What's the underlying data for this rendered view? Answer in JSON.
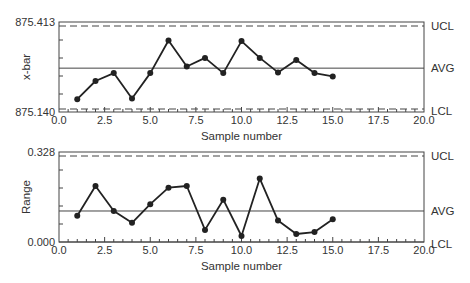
{
  "chart_data": [
    {
      "type": "line",
      "title": "",
      "xlabel": "Sample number",
      "ylabel": "x-bar",
      "xlim": [
        0.0,
        20.0
      ],
      "ylim": [
        875.14,
        875.413
      ],
      "x_tick_labels": [
        "0.0",
        "2.5",
        "5.0",
        "7.5",
        "10.0",
        "12.5",
        "15.0",
        "17.5",
        "20.0"
      ],
      "y_tick_labels": [
        "875.140",
        "875.413"
      ],
      "grid": false,
      "reference_lines": [
        {
          "label": "UCL",
          "value": 875.402,
          "style": "dashed"
        },
        {
          "label": "AVG",
          "value": 875.273,
          "style": "solid"
        },
        {
          "label": "LCL",
          "value": 875.15,
          "style": "dashed"
        }
      ],
      "x": [
        1,
        2,
        3,
        4,
        5,
        6,
        7,
        8,
        9,
        10,
        11,
        12,
        13,
        14,
        15
      ],
      "values": [
        875.179,
        875.234,
        875.258,
        875.181,
        875.258,
        875.357,
        875.278,
        875.304,
        875.258,
        875.355,
        875.304,
        875.26,
        875.298,
        875.258,
        875.248
      ]
    },
    {
      "type": "line",
      "title": "",
      "xlabel": "Sample number",
      "ylabel": "Range",
      "xlim": [
        0.0,
        20.0
      ],
      "ylim": [
        0.0,
        0.328
      ],
      "x_tick_labels": [
        "0.0",
        "2.5",
        "5.0",
        "7.5",
        "10.0",
        "12.5",
        "15.0",
        "17.5",
        "20.0"
      ],
      "y_tick_labels": [
        "0.000",
        "0.328"
      ],
      "grid": false,
      "reference_lines": [
        {
          "label": "UCL",
          "value": 0.315,
          "style": "dashed"
        },
        {
          "label": "AVG",
          "value": 0.113,
          "style": "solid"
        },
        {
          "label": "LCL",
          "value": 0.0,
          "style": "solid"
        }
      ],
      "x": [
        1,
        2,
        3,
        4,
        5,
        6,
        7,
        8,
        9,
        10,
        11,
        12,
        13,
        14,
        15
      ],
      "values": [
        0.096,
        0.204,
        0.113,
        0.07,
        0.138,
        0.198,
        0.204,
        0.044,
        0.154,
        0.022,
        0.231,
        0.078,
        0.029,
        0.036,
        0.083
      ]
    }
  ],
  "colors": {
    "line": "#222222",
    "axis": "#444444",
    "text": "#333333"
  }
}
